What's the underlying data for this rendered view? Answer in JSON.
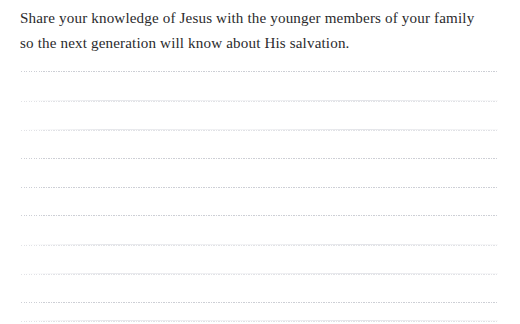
{
  "page": {
    "type": "journal-prompt-page",
    "background_color": "#ffffff",
    "width": 520,
    "height": 324
  },
  "prompt": {
    "full_text": "Share your knowledge of Jesus with the younger members of your family so the next generation will know about His salvation.",
    "lines": [
      "Share your knowledge of Jesus with the younger members of your family",
      "so the next generation will know about His salvation."
    ],
    "text_color": "#2b2b2d",
    "font_size_px": 15,
    "line_height_px": 25
  },
  "writing_area": {
    "label": "blank dotted writing lines",
    "line_color": "#c9cbd2",
    "line_style": "dotted",
    "line_count": 9,
    "left_px": 21,
    "right_px": 498,
    "line_spacing_px": 29.5,
    "lines": [
      {
        "index": 1,
        "y": 71,
        "faint": false,
        "wash": false
      },
      {
        "index": 2,
        "y": 100,
        "faint": true,
        "wash": true
      },
      {
        "index": 3,
        "y": 129,
        "faint": true,
        "wash": true
      },
      {
        "index": 4,
        "y": 158,
        "faint": false,
        "wash": false
      },
      {
        "index": 5,
        "y": 187,
        "faint": false,
        "wash": false
      },
      {
        "index": 6,
        "y": 215,
        "faint": false,
        "wash": false
      },
      {
        "index": 7,
        "y": 244,
        "faint": true,
        "wash": true
      },
      {
        "index": 8,
        "y": 273,
        "faint": true,
        "wash": true
      },
      {
        "index": 9,
        "y": 302,
        "faint": false,
        "wash": false
      },
      {
        "index": 10,
        "y": 320,
        "faint": true,
        "wash": true
      }
    ]
  }
}
